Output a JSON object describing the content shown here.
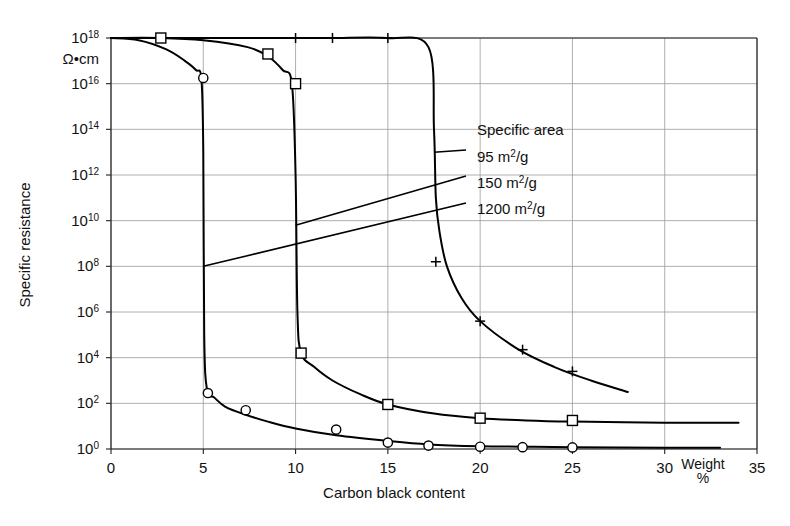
{
  "chart_data": {
    "type": "line",
    "title": "",
    "xlabel": "Carbon black content",
    "ylabel": "Specific resistance",
    "y_unit": "Ω•cm",
    "x_unit_label_line1": "Weight",
    "x_unit_label_line2": "%",
    "xlim": [
      0,
      35
    ],
    "ylim_log10": [
      0,
      18
    ],
    "grid": true,
    "y_scale": "log",
    "xticks": [
      0,
      5,
      10,
      15,
      20,
      25,
      30,
      35
    ],
    "xticklabels": [
      "0",
      "5",
      "10",
      "15",
      "20",
      "25",
      "30",
      "35"
    ],
    "yticks_exp": [
      0,
      2,
      4,
      6,
      8,
      10,
      12,
      14,
      16,
      18
    ],
    "yticklabels": [
      "10⁰",
      "10²",
      "10⁴",
      "10⁶",
      "10⁸",
      "10¹⁰",
      "10¹²",
      "10¹⁴",
      "10¹⁶",
      "10¹⁸"
    ],
    "legend_title": "Specific area",
    "legend_position": "inside-right",
    "series": [
      {
        "name": "95 m²/g",
        "label_base": "95 m",
        "label_sup": "2",
        "label_tail": "/g",
        "marker": "plus",
        "percolation_x": 17.5,
        "points_x": [
          0,
          5,
          10,
          12,
          15,
          17.2,
          17.5,
          17.6,
          17.8,
          18.2,
          19,
          20,
          22,
          24,
          26,
          28
        ],
        "points_y_log10": [
          18,
          18,
          18,
          18,
          18,
          17.6,
          14,
          11,
          9.5,
          8.0,
          6.6,
          5.6,
          4.4,
          3.6,
          3.0,
          2.5
        ],
        "marker_x": [
          10,
          12,
          15,
          17.6,
          20,
          22.3,
          25
        ],
        "marker_y_log10": [
          18,
          18,
          18,
          8.2,
          5.6,
          4.35,
          3.4
        ]
      },
      {
        "name": "150 m²/g",
        "label_base": "150 m",
        "label_sup": "2",
        "label_tail": "/g",
        "marker": "square",
        "percolation_x": 10,
        "points_x": [
          0,
          2.7,
          5,
          7.4,
          8.5,
          9.3,
          9.8,
          10,
          10.1,
          10.3,
          11,
          12,
          13.5,
          15,
          17.5,
          20,
          22.5,
          25,
          30,
          34
        ],
        "points_y_log10": [
          18,
          18,
          17.9,
          17.6,
          17.2,
          16.6,
          16.0,
          12,
          6.0,
          4.2,
          3.6,
          3.0,
          2.4,
          1.95,
          1.55,
          1.35,
          1.25,
          1.2,
          1.15,
          1.15
        ],
        "marker_x": [
          2.7,
          8.5,
          10,
          10.3,
          15,
          20,
          25
        ],
        "marker_y_log10": [
          18,
          17.3,
          16.0,
          4.2,
          1.95,
          1.35,
          1.25
        ]
      },
      {
        "name": "1200 m²/g",
        "label_base": "1200 m",
        "label_sup": "2",
        "label_tail": "/g",
        "marker": "circle",
        "percolation_x": 5,
        "points_x": [
          0,
          1.5,
          3,
          4,
          4.6,
          4.9,
          5,
          5.05,
          5.2,
          5.6,
          6.2,
          7.3,
          8.5,
          10,
          12.2,
          15,
          17.2,
          20,
          22.3,
          25,
          30,
          33
        ],
        "points_y_log10": [
          18,
          17.9,
          17.5,
          17.0,
          16.6,
          16.2,
          13,
          5.0,
          2.6,
          2.25,
          1.85,
          1.5,
          1.2,
          0.9,
          0.6,
          0.35,
          0.2,
          0.12,
          0.1,
          0.08,
          0.05,
          0.05
        ],
        "marker_x": [
          5,
          5.25,
          7.3,
          12.2,
          15,
          17.2,
          20,
          22.3,
          25
        ],
        "marker_y_log10": [
          16.25,
          2.45,
          1.7,
          0.85,
          0.28,
          0.15,
          0.1,
          0.08,
          0.07
        ]
      }
    ],
    "leaders": [
      {
        "series": "95 m²/g",
        "from_x": 17.5,
        "from_y_log10": 13.0,
        "to_px_x": 466,
        "to_px_y": 150
      },
      {
        "series": "150 m²/g",
        "from_x": 10,
        "from_y_log10": 9.8,
        "to_px_x": 466,
        "to_px_y": 176
      },
      {
        "series": "1200 m²/g",
        "from_x": 5,
        "from_y_log10": 8.0,
        "to_px_x": 466,
        "to_px_y": 203
      }
    ]
  }
}
